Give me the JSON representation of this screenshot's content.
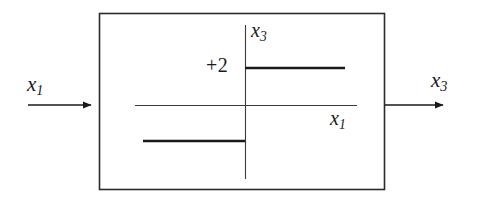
{
  "diagram": {
    "type": "block-diagram",
    "stroke_color": "#1a1a1a",
    "background_color": "#ffffff",
    "block": {
      "name": "nonlinearity-block",
      "x": 99,
      "y": 13,
      "width": 286,
      "height": 177,
      "border_width": 1.6
    },
    "input": {
      "label": "x",
      "subscript": "1",
      "arrow_from_x": 28,
      "arrow_to_x": 99,
      "arrow_y": 105
    },
    "output": {
      "label": "x",
      "subscript": "3",
      "arrow_from_x": 385,
      "arrow_to_x": 452,
      "arrow_y": 105
    },
    "inner_plot": {
      "horizontal_axis": {
        "label": "x",
        "subscript": "1",
        "x_start": 135,
        "x_end": 357,
        "y": 105
      },
      "vertical_axis": {
        "label": "x",
        "subscript": "3",
        "x": 245,
        "y_start": 25,
        "y_end": 179
      },
      "level_label": "+2",
      "upper_segment": {
        "x_start": 245,
        "x_end": 345,
        "y": 68
      },
      "lower_segment": {
        "x_start": 143,
        "x_end": 245,
        "y": 141
      }
    }
  }
}
